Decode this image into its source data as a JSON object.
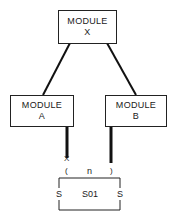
{
  "diagram": {
    "type": "structure-chart",
    "modules": [
      {
        "id": "X",
        "line1": "MODULE",
        "line2": "X"
      },
      {
        "id": "A",
        "line1": "MODULE",
        "line2": "A"
      },
      {
        "id": "B",
        "line1": "MODULE",
        "line2": "B"
      }
    ],
    "connections": [
      {
        "from": "X",
        "to": "A"
      },
      {
        "from": "X",
        "to": "B"
      },
      {
        "from": "A",
        "to": "S01",
        "end_mark": "X"
      },
      {
        "from": "B",
        "to": "S01"
      }
    ],
    "interface": {
      "left_bracket": "(",
      "label": "n",
      "right_bracket": ")",
      "end_mark": "X"
    },
    "data_store": {
      "name": "S01",
      "left_marker": "S",
      "right_marker": "S"
    }
  }
}
